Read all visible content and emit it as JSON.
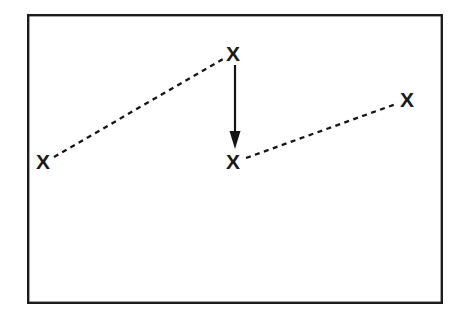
{
  "figure": {
    "title": "",
    "background_color": "#ffffff",
    "ink_color": "#151515",
    "frame": {
      "name": "frame-border",
      "x": 27,
      "y": 14,
      "width": 416,
      "height": 290,
      "stroke_width": 2.4,
      "stroke_color": "#1c1c1c",
      "fill": "#ffffff"
    },
    "markers": [
      {
        "id": "marker-left",
        "label": "X",
        "x": 43,
        "y": 161
      },
      {
        "id": "marker-top-middle",
        "label": "X",
        "x": 233,
        "y": 53
      },
      {
        "id": "marker-bottom-middle",
        "label": "X",
        "x": 233,
        "y": 161
      },
      {
        "id": "marker-right",
        "label": "X",
        "x": 407,
        "y": 99
      }
    ],
    "dashed_connectors": [
      {
        "id": "connector-left-to-top",
        "x1": 54,
        "y1": 157,
        "x2": 223,
        "y2": 59,
        "dash": "5 4.5",
        "stroke_width": 2.3
      },
      {
        "id": "connector-bottom-to-right",
        "x1": 246,
        "y1": 158,
        "x2": 396,
        "y2": 104,
        "dash": "5 4.5",
        "stroke_width": 2.3
      }
    ],
    "arrow": {
      "id": "downward-arrow",
      "x1": 235,
      "y1": 65,
      "x2": 235,
      "y2": 149,
      "stroke_width": 2.2,
      "head_width": 11,
      "head_length": 13,
      "direction": "down"
    }
  }
}
